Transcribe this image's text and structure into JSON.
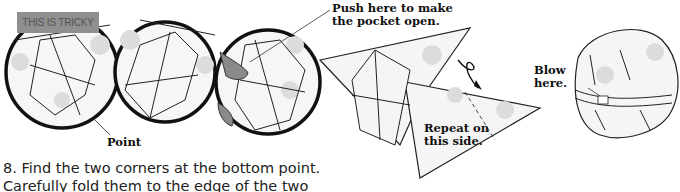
{
  "illustration": {
    "badge": "THIS IS TRICKY",
    "labels": {
      "point": "Point",
      "push_line1": "Push here to make",
      "push_line2": "the pocket open.",
      "repeat_line1": "Repeat on",
      "repeat_line2": "this side.",
      "blow_line1": "Blow",
      "blow_line2": "here."
    }
  },
  "instruction": {
    "line1": "8. Find the two corners at the bottom point.",
    "line2": "Carefully fold them to the edge of the two"
  },
  "colors": {
    "ink": "#1a1a1a",
    "paper": "#f4f4f4",
    "dots": "#d6d6d6",
    "badge": "#8f8f8f",
    "finger": "#8a8a8a"
  }
}
